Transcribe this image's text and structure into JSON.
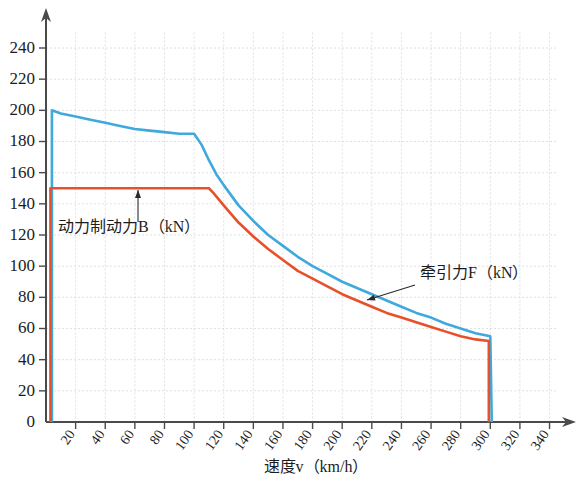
{
  "chart_data": {
    "type": "line",
    "title": "",
    "xlabel": "速度v（km/h）",
    "ylabel": "",
    "xlim": [
      0,
      345
    ],
    "ylim": [
      0,
      250
    ],
    "grid": true,
    "legend_position": "inline-annotations",
    "x_ticks": [
      20,
      40,
      60,
      80,
      100,
      120,
      140,
      160,
      180,
      200,
      220,
      240,
      260,
      280,
      300,
      320,
      340
    ],
    "y_ticks": [
      0,
      20,
      40,
      60,
      80,
      100,
      120,
      140,
      160,
      180,
      200,
      220,
      240
    ],
    "series": [
      {
        "name": "牵引力F（kN）",
        "color": "#3FA9DD",
        "label": "牵引力F（kN）",
        "points": [
          [
            4,
            0
          ],
          [
            4,
            200
          ],
          [
            10,
            198
          ],
          [
            20,
            196
          ],
          [
            30,
            194
          ],
          [
            40,
            192
          ],
          [
            50,
            190
          ],
          [
            60,
            188
          ],
          [
            70,
            187
          ],
          [
            80,
            186
          ],
          [
            90,
            185
          ],
          [
            100,
            185
          ],
          [
            105,
            178
          ],
          [
            110,
            168
          ],
          [
            115,
            159
          ],
          [
            120,
            152
          ],
          [
            130,
            139
          ],
          [
            140,
            129
          ],
          [
            150,
            120
          ],
          [
            160,
            113
          ],
          [
            170,
            106
          ],
          [
            180,
            100
          ],
          [
            190,
            95
          ],
          [
            200,
            90
          ],
          [
            210,
            86
          ],
          [
            220,
            82
          ],
          [
            230,
            78
          ],
          [
            240,
            74
          ],
          [
            250,
            70
          ],
          [
            260,
            67
          ],
          [
            270,
            63
          ],
          [
            280,
            60
          ],
          [
            290,
            57
          ],
          [
            300,
            55
          ],
          [
            301,
            0
          ]
        ]
      },
      {
        "name": "动力制动力B（kN）",
        "color": "#E8502A",
        "label": "动力制动力B（kN）",
        "points": [
          [
            3,
            0
          ],
          [
            3,
            150
          ],
          [
            10,
            150
          ],
          [
            40,
            150
          ],
          [
            70,
            150
          ],
          [
            100,
            150
          ],
          [
            110,
            150
          ],
          [
            113,
            147
          ],
          [
            120,
            139
          ],
          [
            130,
            128
          ],
          [
            140,
            119
          ],
          [
            150,
            111
          ],
          [
            160,
            104
          ],
          [
            170,
            97
          ],
          [
            180,
            92
          ],
          [
            190,
            87
          ],
          [
            200,
            82
          ],
          [
            210,
            78
          ],
          [
            220,
            74
          ],
          [
            230,
            70
          ],
          [
            240,
            67
          ],
          [
            250,
            64
          ],
          [
            260,
            61
          ],
          [
            270,
            58
          ],
          [
            280,
            55
          ],
          [
            290,
            53
          ],
          [
            299,
            52
          ],
          [
            299,
            0
          ]
        ]
      }
    ],
    "annotations": [
      {
        "name": "brake-force-label",
        "text": "动力制动力B（kN）",
        "text_x": 58,
        "text_y": 232,
        "arrow_from_x": 138,
        "arrow_from_y": 222,
        "arrow_to_x": 138,
        "arrow_to_y": 190
      },
      {
        "name": "traction-force-label",
        "text": "牵引力F（kN）",
        "text_x": 420,
        "text_y": 278,
        "arrow_from_x": 415,
        "arrow_from_y": 285,
        "arrow_to_x": 367,
        "arrow_to_y": 300
      }
    ]
  },
  "colors": {
    "blue": "#3FA9DD",
    "red": "#E8502A",
    "axis": "#4a4a4a",
    "grid": "#d8d8d8",
    "text": "#1c1c1c"
  }
}
